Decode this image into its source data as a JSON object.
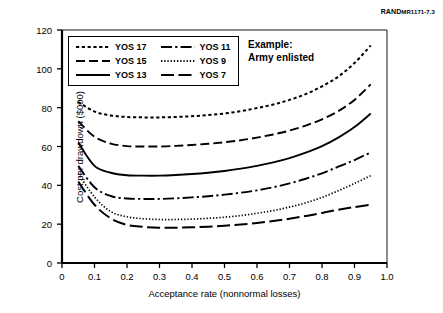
{
  "figure": {
    "report_label_prefix": "RAND",
    "report_label_suffix": "MR1171-7.3"
  },
  "annotation": {
    "line1": "Example:",
    "line2": "Army enlisted"
  },
  "chart_data": {
    "type": "line",
    "title": "",
    "xlabel": "Acceptance rate (nonnormal losses)",
    "ylabel": "Cost per drawdown ($000)",
    "xlim": [
      0,
      1.0
    ],
    "ylim": [
      0,
      120
    ],
    "xticks": [
      "0",
      "0.1",
      "0.2",
      "0.3",
      "0.4",
      "0.5",
      "0.6",
      "0.7",
      "0.8",
      "0.9",
      "1.0"
    ],
    "xtick_values": [
      0,
      0.1,
      0.2,
      0.3,
      0.4,
      0.5,
      0.6,
      0.7,
      0.8,
      0.9,
      1.0
    ],
    "yticks": [
      "0",
      "20",
      "40",
      "60",
      "80",
      "100",
      "120"
    ],
    "ytick_values": [
      0,
      20,
      40,
      60,
      80,
      100,
      120
    ],
    "grid": false,
    "legend_position": "upper-left-inside",
    "x": [
      0.05,
      0.1,
      0.15,
      0.2,
      0.25,
      0.3,
      0.35,
      0.4,
      0.45,
      0.5,
      0.55,
      0.6,
      0.65,
      0.7,
      0.75,
      0.8,
      0.85,
      0.9,
      0.95
    ],
    "series": [
      {
        "name": "YOS 17",
        "style": "dotted",
        "values": [
          83.0,
          78.0,
          76.0,
          75.2,
          75.0,
          75.0,
          75.2,
          75.6,
          76.2,
          77.0,
          78.2,
          79.8,
          81.6,
          84.0,
          87.0,
          91.0,
          96.0,
          103.0,
          112.0
        ]
      },
      {
        "name": "YOS 15",
        "style": "dashed",
        "values": [
          73.0,
          65.0,
          61.5,
          60.2,
          60.0,
          60.0,
          60.3,
          60.8,
          61.4,
          62.2,
          63.2,
          64.6,
          66.2,
          68.2,
          70.8,
          74.0,
          78.2,
          84.0,
          92.0
        ]
      },
      {
        "name": "YOS 13",
        "style": "solid",
        "values": [
          62.0,
          50.0,
          46.5,
          45.2,
          45.0,
          45.0,
          45.3,
          45.8,
          46.5,
          47.4,
          48.6,
          50.0,
          51.8,
          54.0,
          56.8,
          60.2,
          64.6,
          70.0,
          77.0
        ]
      },
      {
        "name": "YOS 11",
        "style": "dashdot",
        "values": [
          50.0,
          39.0,
          34.5,
          33.2,
          33.0,
          33.0,
          33.3,
          33.8,
          34.4,
          35.2,
          36.2,
          37.4,
          39.0,
          41.0,
          43.4,
          46.2,
          49.6,
          53.0,
          57.0
        ]
      },
      {
        "name": "YOS 9",
        "style": "finedot",
        "values": [
          46.0,
          34.0,
          26.5,
          23.8,
          22.8,
          22.4,
          22.4,
          22.6,
          23.0,
          23.6,
          24.4,
          25.6,
          27.0,
          28.8,
          31.0,
          33.8,
          37.2,
          41.0,
          45.0
        ]
      },
      {
        "name": "YOS 7",
        "style": "longdash",
        "values": [
          42.0,
          30.0,
          23.0,
          19.6,
          18.6,
          18.2,
          18.2,
          18.4,
          18.7,
          19.2,
          19.8,
          20.6,
          21.6,
          22.8,
          24.2,
          25.8,
          27.4,
          28.8,
          30.0
        ]
      }
    ]
  }
}
